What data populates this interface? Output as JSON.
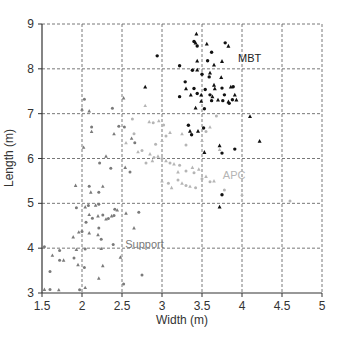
{
  "chart_data": {
    "type": "scatter",
    "title": "",
    "xlabel": "Width (m)",
    "ylabel": "Length (m)",
    "xlim": [
      1.5,
      5
    ],
    "ylim": [
      3,
      9
    ],
    "xticks": [
      "1.5",
      "2",
      "2.5",
      "3",
      "3.5",
      "4",
      "4.5",
      "5"
    ],
    "yticks": [
      "3",
      "4",
      "5",
      "6",
      "7",
      "8",
      "9"
    ],
    "grid": true,
    "legend": "none (inline annotations)",
    "annotations": [
      {
        "text": "MBT",
        "x": 3.95,
        "y": 8.15,
        "color": "#222222"
      },
      {
        "text": "APC",
        "x": 3.76,
        "y": 5.55,
        "color": "#b5b5b5"
      },
      {
        "text": "Support",
        "x": 2.54,
        "y": 4.0,
        "color": "#7a7a7a"
      }
    ],
    "series": [
      {
        "name": "MBT",
        "color": "#111111",
        "points": [
          [
            3.43,
            8.78
          ],
          [
            3.4,
            8.61
          ],
          [
            3.42,
            8.58
          ],
          [
            3.44,
            8.51
          ],
          [
            3.56,
            8.56
          ],
          [
            3.79,
            8.58
          ],
          [
            3.83,
            8.51
          ],
          [
            3.62,
            8.37
          ],
          [
            3.44,
            8.18
          ],
          [
            3.57,
            8.18
          ],
          [
            3.75,
            8.17
          ],
          [
            3.22,
            8.07
          ],
          [
            3.65,
            8.09
          ],
          [
            3.38,
            7.97
          ],
          [
            3.44,
            7.98
          ],
          [
            3.5,
            7.88
          ],
          [
            3.6,
            7.91
          ],
          [
            3.59,
            7.82
          ],
          [
            3.74,
            7.81
          ],
          [
            3.29,
            7.71
          ],
          [
            3.3,
            7.56
          ],
          [
            3.4,
            7.56
          ],
          [
            3.65,
            7.64
          ],
          [
            3.54,
            7.54
          ],
          [
            3.66,
            7.56
          ],
          [
            3.75,
            7.57
          ],
          [
            3.86,
            7.6
          ],
          [
            3.89,
            7.6
          ],
          [
            3.36,
            7.42
          ],
          [
            3.44,
            7.45
          ],
          [
            3.49,
            7.42
          ],
          [
            3.6,
            7.42
          ],
          [
            3.63,
            7.38
          ],
          [
            3.78,
            7.42
          ],
          [
            3.91,
            7.42
          ],
          [
            3.22,
            7.38
          ],
          [
            3.49,
            7.28
          ],
          [
            3.62,
            7.29
          ],
          [
            3.7,
            7.31
          ],
          [
            3.76,
            7.29
          ],
          [
            3.83,
            7.27
          ],
          [
            3.88,
            7.31
          ],
          [
            3.93,
            7.31
          ],
          [
            3.84,
            7.23
          ],
          [
            3.42,
            7.13
          ],
          [
            3.53,
            7.11
          ],
          [
            4.1,
            6.94
          ],
          [
            3.33,
            6.74
          ],
          [
            3.45,
            6.61
          ],
          [
            3.52,
            6.68
          ],
          [
            3.35,
            6.61
          ],
          [
            3.37,
            6.53
          ],
          [
            3.72,
            6.29
          ],
          [
            3.91,
            6.21
          ],
          [
            3.53,
            6.14
          ],
          [
            3.75,
            6.12
          ],
          [
            4.22,
            6.39
          ],
          [
            2.94,
            8.29
          ],
          [
            2.79,
            7.6
          ],
          [
            3.75,
            5.19
          ],
          [
            3.72,
            4.92
          ]
        ]
      },
      {
        "name": "APC",
        "color": "#b5b5b5",
        "points": [
          [
            2.79,
            7.18
          ],
          [
            2.63,
            6.88
          ],
          [
            2.84,
            6.82
          ],
          [
            2.89,
            6.8
          ],
          [
            2.96,
            6.84
          ],
          [
            3.02,
            6.75
          ],
          [
            3.1,
            6.58
          ],
          [
            3.05,
            6.5
          ],
          [
            3.0,
            6.4
          ],
          [
            2.92,
            6.32
          ],
          [
            2.7,
            6.15
          ],
          [
            2.75,
            6.18
          ],
          [
            2.85,
            6.1
          ],
          [
            2.9,
            6.02
          ],
          [
            2.95,
            6.05
          ],
          [
            3.0,
            6.0
          ],
          [
            3.05,
            5.95
          ],
          [
            3.1,
            5.9
          ],
          [
            3.15,
            5.88
          ],
          [
            3.22,
            5.85
          ],
          [
            2.88,
            5.95
          ],
          [
            2.8,
            5.9
          ],
          [
            3.2,
            5.7
          ],
          [
            3.3,
            5.72
          ],
          [
            3.38,
            5.8
          ],
          [
            3.4,
            5.68
          ],
          [
            3.46,
            5.76
          ],
          [
            3.2,
            5.52
          ],
          [
            3.25,
            5.45
          ],
          [
            3.3,
            5.4
          ],
          [
            3.35,
            5.38
          ],
          [
            3.42,
            5.35
          ],
          [
            3.0,
            5.5
          ],
          [
            3.08,
            5.45
          ],
          [
            3.12,
            5.35
          ],
          [
            3.5,
            5.55
          ],
          [
            3.55,
            5.6
          ],
          [
            3.6,
            5.48
          ],
          [
            3.65,
            5.5
          ],
          [
            3.78,
            5.3
          ],
          [
            4.0,
            5.2
          ],
          [
            4.6,
            5.05
          ],
          [
            3.5,
            6.4
          ],
          [
            3.55,
            6.6
          ],
          [
            3.6,
            6.7
          ],
          [
            3.68,
            6.95
          ],
          [
            3.72,
            6.2
          ],
          [
            3.3,
            6.3
          ],
          [
            3.25,
            6.55
          ],
          [
            2.65,
            6.55
          ],
          [
            2.55,
            6.35
          ]
        ]
      },
      {
        "name": "Support",
        "color": "#7a7a7a",
        "points": [
          [
            2.0,
            7.1
          ],
          [
            2.03,
            7.32
          ],
          [
            2.09,
            7.06
          ],
          [
            2.38,
            7.12
          ],
          [
            2.52,
            7.35
          ],
          [
            2.12,
            6.7
          ],
          [
            2.12,
            6.6
          ],
          [
            2.46,
            6.72
          ],
          [
            2.4,
            6.55
          ],
          [
            2.53,
            6.7
          ],
          [
            2.62,
            6.45
          ],
          [
            2.66,
            6.35
          ],
          [
            2.02,
            6.25
          ],
          [
            2.22,
            5.9
          ],
          [
            2.3,
            6.05
          ],
          [
            2.36,
            5.78
          ],
          [
            2.54,
            5.8
          ],
          [
            2.6,
            5.7
          ],
          [
            1.92,
            5.4
          ],
          [
            2.09,
            5.38
          ],
          [
            2.11,
            5.25
          ],
          [
            2.21,
            5.25
          ],
          [
            2.26,
            5.38
          ],
          [
            1.93,
            4.9
          ],
          [
            2.04,
            4.92
          ],
          [
            2.08,
            4.95
          ],
          [
            2.17,
            4.96
          ],
          [
            2.21,
            4.98
          ],
          [
            2.09,
            4.75
          ],
          [
            2.13,
            4.67
          ],
          [
            2.2,
            4.72
          ],
          [
            2.26,
            4.74
          ],
          [
            2.3,
            4.65
          ],
          [
            2.33,
            4.66
          ],
          [
            2.37,
            4.72
          ],
          [
            2.4,
            4.73
          ],
          [
            2.44,
            4.85
          ],
          [
            2.41,
            4.87
          ],
          [
            2.55,
            4.78
          ],
          [
            2.71,
            4.8
          ],
          [
            2.65,
            4.45
          ],
          [
            2.05,
            4.58
          ],
          [
            1.96,
            4.36
          ],
          [
            2.0,
            4.37
          ],
          [
            2.09,
            4.34
          ],
          [
            2.21,
            4.45
          ],
          [
            2.2,
            4.3
          ],
          [
            2.24,
            4.2
          ],
          [
            1.89,
            4.25
          ],
          [
            1.53,
            4.03
          ],
          [
            1.63,
            3.84
          ],
          [
            1.72,
            3.95
          ],
          [
            1.93,
            3.97
          ],
          [
            2.04,
            3.98
          ],
          [
            2.24,
            3.99
          ],
          [
            2.39,
            4.08
          ],
          [
            2.48,
            3.8
          ],
          [
            1.72,
            3.73
          ],
          [
            1.77,
            3.73
          ],
          [
            1.9,
            3.78
          ],
          [
            1.95,
            3.63
          ],
          [
            2.03,
            3.57
          ],
          [
            2.26,
            3.61
          ],
          [
            1.6,
            3.48
          ],
          [
            2.21,
            3.33
          ],
          [
            2.75,
            3.4
          ],
          [
            1.53,
            3.08
          ],
          [
            1.6,
            3.08
          ],
          [
            1.71,
            3.07
          ],
          [
            1.97,
            3.07
          ],
          [
            2.04,
            3.12
          ],
          [
            2.52,
            3.2
          ]
        ]
      }
    ]
  }
}
